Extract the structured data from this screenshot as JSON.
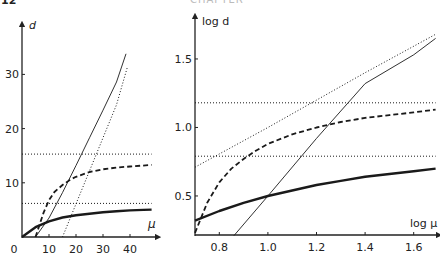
{
  "page": {
    "number": "12",
    "running_head": "CHAPTER"
  },
  "chart_data": [
    {
      "type": "line",
      "title": "",
      "xlabel": "μ",
      "ylabel": "d",
      "xlim": [
        0,
        48
      ],
      "ylim": [
        0,
        35
      ],
      "x_ticks": [
        0,
        10,
        20,
        30,
        40
      ],
      "x_tick_labels": [
        "0",
        "10",
        "20",
        "30",
        "40"
      ],
      "y_ticks": [
        10,
        20,
        30
      ],
      "y_tick_labels": [
        "10",
        "20",
        "30"
      ],
      "grid": false,
      "legend": null,
      "series": [
        {
          "name": "thick-solid",
          "style": "solid-thick",
          "x": [
            0,
            5,
            10,
            15,
            20,
            25,
            30,
            35,
            40,
            45,
            48
          ],
          "y": [
            0,
            1.8,
            2.9,
            3.6,
            4.0,
            4.3,
            4.55,
            4.75,
            4.9,
            5.0,
            5.05
          ]
        },
        {
          "name": "dashed",
          "style": "dashed",
          "x": [
            5,
            8,
            10,
            12,
            15,
            18,
            20,
            25,
            30,
            35,
            40,
            48
          ],
          "y": [
            0,
            4.5,
            6.8,
            8.3,
            9.6,
            10.6,
            11.1,
            12.0,
            12.5,
            12.8,
            13.0,
            13.3
          ]
        },
        {
          "name": "thin-solid",
          "style": "solid-thin",
          "x": [
            5,
            10,
            15,
            20,
            25,
            30,
            35,
            38.5
          ],
          "y": [
            0,
            3.5,
            8.2,
            13.2,
            18.3,
            23.4,
            28.6,
            33.8
          ]
        },
        {
          "name": "dotted-diagonal",
          "style": "dotted",
          "x": [
            15,
            20,
            25,
            30,
            35,
            39
          ],
          "y": [
            0,
            6.1,
            12.2,
            18.3,
            24.4,
            31.3
          ]
        },
        {
          "name": "dotted-upper-asymptote",
          "style": "dotted",
          "x": [
            0,
            48
          ],
          "y": [
            15.3,
            15.3
          ]
        },
        {
          "name": "dotted-lower-asymptote",
          "style": "dotted",
          "x": [
            0,
            48
          ],
          "y": [
            6.2,
            6.2
          ]
        }
      ]
    },
    {
      "type": "line",
      "title": "",
      "xlabel": "log μ",
      "ylabel": "log d",
      "xlim": [
        0.7,
        1.7
      ],
      "ylim": [
        0.21,
        1.72
      ],
      "x_ticks": [
        0.8,
        1.0,
        1.2,
        1.4,
        1.6
      ],
      "x_tick_labels": [
        "0.8",
        "1.0",
        "1.2",
        "1.4",
        "1.6"
      ],
      "y_ticks": [
        0.5,
        1.0,
        1.5
      ],
      "y_tick_labels": [
        "0.5",
        "1.0",
        "1.5"
      ],
      "grid": false,
      "legend": null,
      "series": [
        {
          "name": "thick-solid",
          "style": "solid-thick",
          "x": [
            0.7,
            0.8,
            0.9,
            1.0,
            1.1,
            1.2,
            1.3,
            1.4,
            1.5,
            1.6,
            1.69
          ],
          "y": [
            0.32,
            0.39,
            0.45,
            0.5,
            0.54,
            0.58,
            0.61,
            0.64,
            0.66,
            0.68,
            0.7
          ]
        },
        {
          "name": "dashed",
          "style": "dashed",
          "x": [
            0.7,
            0.75,
            0.8,
            0.85,
            0.9,
            0.95,
            1.0,
            1.1,
            1.2,
            1.3,
            1.4,
            1.5,
            1.6,
            1.69
          ],
          "y": [
            0.23,
            0.45,
            0.6,
            0.7,
            0.77,
            0.83,
            0.88,
            0.95,
            1.0,
            1.04,
            1.07,
            1.09,
            1.11,
            1.13
          ]
        },
        {
          "name": "thin-solid",
          "style": "solid-thin",
          "x": [
            0.86,
            1.0,
            1.2,
            1.4,
            1.6,
            1.69
          ],
          "y": [
            0.21,
            0.5,
            0.92,
            1.32,
            1.53,
            1.65
          ]
        },
        {
          "name": "dotted-diagonal",
          "style": "dotted",
          "x": [
            0.7,
            1.0,
            1.2,
            1.4,
            1.69
          ],
          "y": [
            0.71,
            1.0,
            1.2,
            1.4,
            1.68
          ]
        },
        {
          "name": "dotted-upper-asymptote",
          "style": "dotted",
          "x": [
            0.7,
            1.69
          ],
          "y": [
            1.18,
            1.18
          ]
        },
        {
          "name": "dotted-lower-asymptote",
          "style": "dotted",
          "x": [
            0.7,
            1.69
          ],
          "y": [
            0.79,
            0.79
          ]
        }
      ]
    }
  ]
}
